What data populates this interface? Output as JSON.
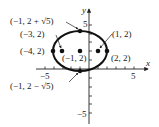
{
  "diagram": {
    "type": "ellipse-graph",
    "axes": {
      "x_label": "x",
      "y_label": "y",
      "x_ticks": {
        "min": -5,
        "max": 5,
        "labeled": [
          "-5",
          "5"
        ]
      },
      "y_ticks": {
        "min": -5,
        "max": 5,
        "labeled": [
          "5",
          "-5"
        ]
      }
    },
    "ellipse": {
      "center": [
        -1,
        2
      ],
      "semi_major_x": 3,
      "semi_minor_y": 2.236
    },
    "points": [
      {
        "id": "top-vertex",
        "coords": [
          -1,
          4.236
        ],
        "label": "(−1, 2 + √5)"
      },
      {
        "id": "focus-left",
        "coords": [
          -3,
          2
        ],
        "label": "(−3, 2)"
      },
      {
        "id": "vertex-left",
        "coords": [
          -4,
          2
        ],
        "label": "(−4, 2)"
      },
      {
        "id": "center",
        "coords": [
          -1,
          2
        ],
        "label": "(−1, 2)"
      },
      {
        "id": "focus-right",
        "coords": [
          1,
          2
        ],
        "label": "(1, 2)"
      },
      {
        "id": "vertex-right",
        "coords": [
          2,
          2
        ],
        "label": "(2, 2)"
      },
      {
        "id": "bottom-vertex",
        "coords": [
          -1,
          -0.236
        ],
        "label": "(−1, 2 − √5)"
      }
    ],
    "tick_labels": {
      "x_neg5": "−5",
      "x_pos5": "5",
      "y_pos5": "5",
      "y_neg5": "−5"
    }
  }
}
